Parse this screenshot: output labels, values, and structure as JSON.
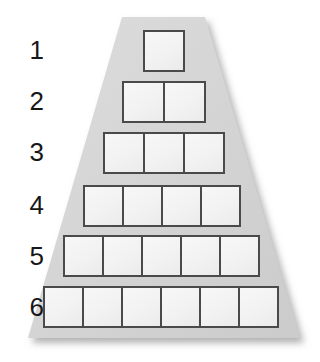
{
  "figure": {
    "shape": "trapezoid",
    "row_count": 6,
    "colors": {
      "background": "#ffffff",
      "trapezoid_fill": "#d3d3d4",
      "trapezoid_fill_light": "#dcdcdd",
      "cell_fill": "#f3f3f3",
      "cell_border": "#4a4a4a",
      "label_text": "#17171a",
      "shadow": "#b8b8b8"
    },
    "geometry": {
      "canvas_width": 320,
      "canvas_height": 362,
      "trapezoid_top_y": 17,
      "trapezoid_bottom_y": 338,
      "trapezoid_top_left_x": 122,
      "trapezoid_top_right_x": 205,
      "trapezoid_bottom_left_x": 28,
      "trapezoid_bottom_right_x": 300
    }
  },
  "rows": [
    {
      "label": "1",
      "cells": 1,
      "label_x": 14,
      "label_y": 37,
      "row_left": 143,
      "row_top": 30,
      "cell_w": 42,
      "cell_h": 42
    },
    {
      "label": "2",
      "cells": 2,
      "label_x": 14,
      "label_y": 88,
      "row_left": 122,
      "row_top": 81,
      "cell_w": 43,
      "cell_h": 42
    },
    {
      "label": "3",
      "cells": 3,
      "label_x": 14,
      "label_y": 139,
      "row_left": 103,
      "row_top": 132,
      "cell_w": 42,
      "cell_h": 42
    },
    {
      "label": "4",
      "cells": 4,
      "label_x": 14,
      "label_y": 192,
      "row_left": 83,
      "row_top": 185,
      "cell_w": 41,
      "cell_h": 42
    },
    {
      "label": "5",
      "cells": 5,
      "label_x": 14,
      "label_y": 243,
      "row_left": 63,
      "row_top": 235,
      "cell_w": 41,
      "cell_h": 42
    },
    {
      "label": "6",
      "cells": 6,
      "label_x": 14,
      "label_y": 294,
      "row_left": 43,
      "row_top": 286,
      "cell_w": 41,
      "cell_h": 42
    }
  ]
}
